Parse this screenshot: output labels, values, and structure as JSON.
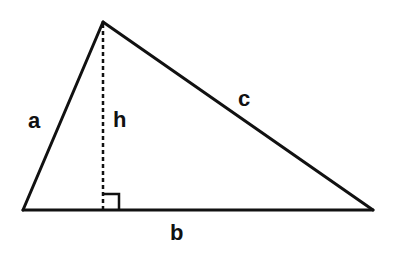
{
  "diagram": {
    "type": "triangle",
    "colors": {
      "stroke": "#111111",
      "background": "#ffffff"
    },
    "vertices": {
      "left": [
        23,
        210
      ],
      "apex": [
        103,
        22
      ],
      "right": [
        373,
        210
      ]
    },
    "altitude": {
      "from": [
        103,
        22
      ],
      "to": [
        103,
        210
      ],
      "style": "dashed"
    },
    "right_angle_marker": {
      "x": 103,
      "y": 194,
      "size": 16
    },
    "labels": {
      "a": "a",
      "b": "b",
      "c": "c",
      "h": "h"
    }
  }
}
